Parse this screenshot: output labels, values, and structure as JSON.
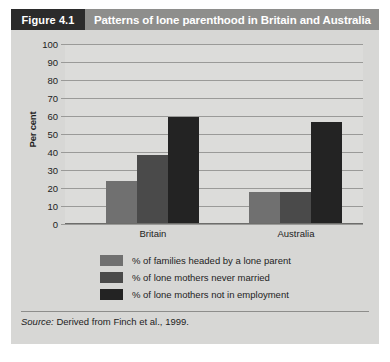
{
  "figure": {
    "tag": "Figure 4.1",
    "title": "Patterns of lone parenthood in Britain and Australia",
    "source_prefix": "Source:",
    "source_text": " Derived from Finch et al., 1999."
  },
  "colors": {
    "tag_bg": "#2b2b2b",
    "title_bg": "#8e8e8c",
    "card_bg": "#d7d7d5",
    "plot_bg": "#dcdcda",
    "gridline": "#9a9a98",
    "series_1": "#707070",
    "series_2": "#4a4a4a",
    "series_3": "#232323"
  },
  "chart_data": {
    "type": "bar",
    "title": "Patterns of lone parenthood in Britain and Australia",
    "xlabel": "",
    "ylabel": "Per cent",
    "ylim": [
      0,
      100
    ],
    "yticks": [
      0,
      10,
      20,
      30,
      40,
      50,
      60,
      70,
      80,
      90,
      100
    ],
    "grid": true,
    "legend_position": "bottom",
    "categories": [
      "Britain",
      "Australia"
    ],
    "series": [
      {
        "name": "% of families headed by a lone parent",
        "color": "#707070",
        "values": [
          23.5,
          17
        ]
      },
      {
        "name": "% of lone mothers never married",
        "color": "#4a4a4a",
        "values": [
          38,
          17
        ]
      },
      {
        "name": "% of lone mothers not in employment",
        "color": "#232323",
        "values": [
          59,
          56
        ]
      }
    ]
  }
}
